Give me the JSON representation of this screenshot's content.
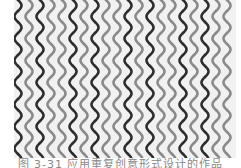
{
  "figure": {
    "background": "#f1f1f1",
    "line_spacing": 11,
    "wave_period": 22,
    "wave_amplitude": 3.5,
    "stroke_width": 2.6,
    "start_x": 4,
    "lines": [
      {
        "color": "#2e2e2e"
      },
      {
        "color": "#8a8a8a"
      },
      {
        "color": "#2e2e2e"
      },
      {
        "color": "#8a8a8a"
      },
      {
        "color": "#8a8a8a"
      },
      {
        "color": "#2e2e2e"
      },
      {
        "color": "#8a8a8a"
      },
      {
        "color": "#2e2e2e"
      },
      {
        "color": "#8a8a8a"
      },
      {
        "color": "#8a8a8a"
      },
      {
        "color": "#2e2e2e"
      },
      {
        "color": "#8a8a8a"
      },
      {
        "color": "#2e2e2e"
      },
      {
        "color": "#8a8a8a"
      },
      {
        "color": "#8a8a8a"
      },
      {
        "color": "#2e2e2e"
      },
      {
        "color": "#8a8a8a"
      },
      {
        "color": "#2e2e2e"
      },
      {
        "color": "#8a8a8a"
      },
      {
        "color": "#8a8a8a"
      }
    ]
  },
  "caption": {
    "text": "图 3-31   应用重复创意形式设计的作品"
  }
}
